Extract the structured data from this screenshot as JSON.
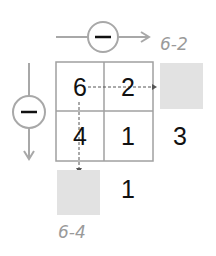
{
  "colors": {
    "line": "#a8a8a8",
    "grid": "#a0a0a0",
    "text": "#111111",
    "label": "#9a9a9a",
    "blank_box": "#e2e2e2",
    "minus_sign": "#111111"
  },
  "horizontal_operation": {
    "operator": "−",
    "result_label": "6-2"
  },
  "vertical_operation": {
    "operator": "−",
    "result_label": "6-4"
  },
  "grid": {
    "cells": [
      [
        "6",
        "2"
      ],
      [
        "4",
        "1"
      ]
    ]
  },
  "row_results": [
    "",
    "3"
  ],
  "column_results": [
    "",
    "1"
  ]
}
